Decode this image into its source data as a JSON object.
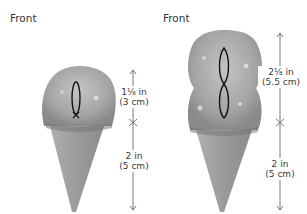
{
  "left_figure": {
    "view_label": "Front",
    "scoop_height": {
      "imperial": "1⅛ in",
      "metric": "(3 cm)"
    },
    "cone_height": {
      "imperial": "2 in",
      "metric": "(5 cm)"
    }
  },
  "right_figure": {
    "view_label": "Front",
    "scoop_height": {
      "imperial": "2⅛ in",
      "metric": "(5.5 cm)"
    },
    "cone_height": {
      "imperial": "2 in",
      "metric": "(5 cm)"
    }
  },
  "colors": {
    "scoop": "#a9a9a9",
    "scoop_dark": "#6e6e6e",
    "cone": "#9c9c9c",
    "line": "#555555",
    "stitch": "#111111"
  }
}
